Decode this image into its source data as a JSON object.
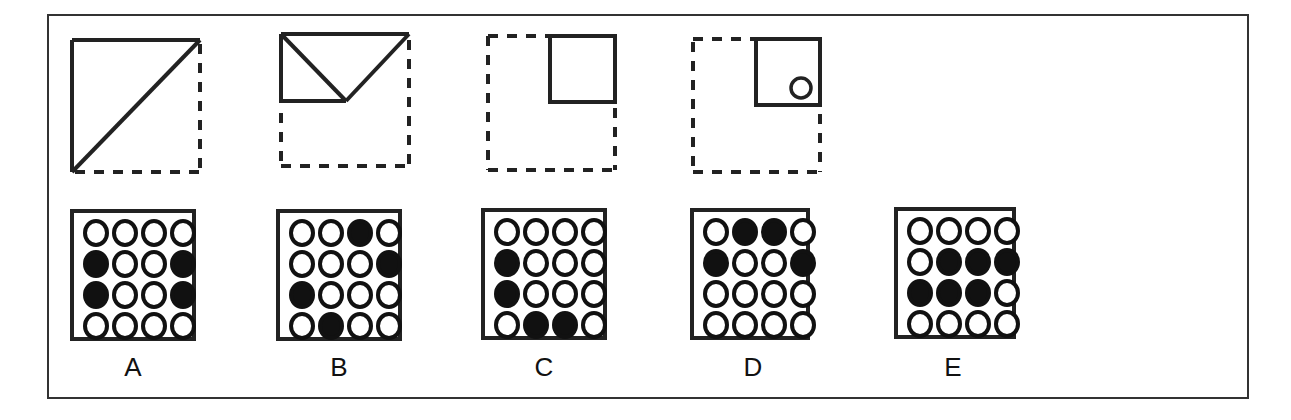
{
  "puzzle": {
    "sequence": [
      {
        "id": "fig1",
        "description": "dashed square with solid top edge, solid left edge and solid diagonal from bottom-left to top-right"
      },
      {
        "id": "fig2",
        "description": "dashed square with solid top edge and a solid rectangle in upper-left half with a V shape"
      },
      {
        "id": "fig3",
        "description": "dashed square with a small solid square in upper-right"
      },
      {
        "id": "fig4",
        "description": "dashed square with a small solid square in upper-right containing a small circle"
      }
    ],
    "options": [
      {
        "label": "A",
        "grid": [
          [
            0,
            0,
            0,
            0
          ],
          [
            1,
            0,
            0,
            1
          ],
          [
            1,
            0,
            0,
            1
          ],
          [
            0,
            0,
            0,
            0
          ]
        ]
      },
      {
        "label": "B",
        "grid": [
          [
            0,
            0,
            1,
            0
          ],
          [
            0,
            0,
            0,
            1
          ],
          [
            1,
            0,
            0,
            0
          ],
          [
            0,
            1,
            0,
            0
          ]
        ]
      },
      {
        "label": "C",
        "grid": [
          [
            0,
            0,
            0,
            0
          ],
          [
            1,
            0,
            0,
            0
          ],
          [
            1,
            0,
            0,
            0
          ],
          [
            0,
            1,
            1,
            0
          ]
        ]
      },
      {
        "label": "D",
        "grid": [
          [
            0,
            1,
            1,
            0
          ],
          [
            1,
            0,
            0,
            1
          ],
          [
            0,
            0,
            0,
            0
          ],
          [
            0,
            0,
            0,
            0
          ]
        ]
      },
      {
        "label": "E",
        "grid": [
          [
            0,
            0,
            0,
            0
          ],
          [
            0,
            1,
            1,
            1
          ],
          [
            1,
            1,
            1,
            0
          ],
          [
            0,
            0,
            0,
            0
          ]
        ]
      }
    ]
  }
}
